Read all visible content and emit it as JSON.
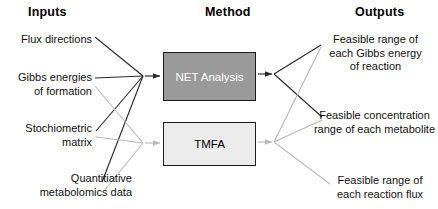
{
  "headers": {
    "inputs": "Inputs",
    "method": "Method",
    "outputs": "Outputs"
  },
  "inputs": [
    {
      "label": "Flux directions"
    },
    {
      "label": "Gibbs energies\nof formation"
    },
    {
      "label": "Stochiometric\nmatrix"
    },
    {
      "label": "Quantitiative\nmetabolomics data"
    }
  ],
  "methods": [
    {
      "label": "NET Analysis",
      "fill": "#9a9a9a",
      "text_color": "#ffffff"
    },
    {
      "label": "TMFA",
      "fill": "#ececec",
      "text_color": "#000000"
    }
  ],
  "outputs": [
    {
      "label": "Feasible range of\neach Gibbs energy\nof reaction"
    },
    {
      "label": "Feasible concentration\nrange of each metabolite"
    },
    {
      "label": "Feasible range of\neach reaction flux"
    }
  ],
  "colors": {
    "dark_wire": "#2b2b2b",
    "light_wire": "#b9b9b9",
    "box_border": "#1a1a1a",
    "text": "#111111",
    "background": "#ffffff"
  }
}
